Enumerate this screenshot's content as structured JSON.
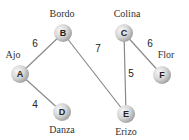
{
  "graph": {
    "nodes": [
      {
        "id": "A",
        "letter": "A",
        "name": "Ajo",
        "cx": 20,
        "cy": 74,
        "lx": 13,
        "ly": 58,
        "anchor": "middle"
      },
      {
        "id": "B",
        "letter": "B",
        "name": "Bordo",
        "cx": 63,
        "cy": 33,
        "lx": 62,
        "ly": 17,
        "anchor": "middle"
      },
      {
        "id": "C",
        "letter": "C",
        "name": "Colina",
        "cx": 124,
        "cy": 33,
        "lx": 127,
        "ly": 17,
        "anchor": "middle"
      },
      {
        "id": "D",
        "letter": "D",
        "name": "Danza",
        "cx": 62,
        "cy": 112,
        "lx": 62,
        "ly": 133,
        "anchor": "middle"
      },
      {
        "id": "E",
        "letter": "E",
        "name": "Erizo",
        "cx": 126,
        "cy": 114,
        "lx": 126,
        "ly": 135,
        "anchor": "middle"
      },
      {
        "id": "F",
        "letter": "F",
        "name": "Flor",
        "cx": 162,
        "cy": 75,
        "lx": 166,
        "ly": 58,
        "anchor": "middle"
      }
    ],
    "edges": [
      {
        "from": "A",
        "to": "B",
        "weight": "6",
        "wx": 35,
        "wy": 47
      },
      {
        "from": "B",
        "to": "E",
        "weight": "7",
        "wx": 98,
        "wy": 52
      },
      {
        "from": "C",
        "to": "E",
        "weight": "5",
        "wx": 131,
        "wy": 77
      },
      {
        "from": "C",
        "to": "F",
        "weight": "6",
        "wx": 150,
        "wy": 47
      },
      {
        "from": "A",
        "to": "D",
        "weight": "4",
        "wx": 35,
        "wy": 108
      }
    ],
    "colors": {
      "node_fill_light": "#f2f2f2",
      "node_fill_dark": "#a8a8a8",
      "edge": "#8a8a8a",
      "text": "#333333"
    }
  }
}
